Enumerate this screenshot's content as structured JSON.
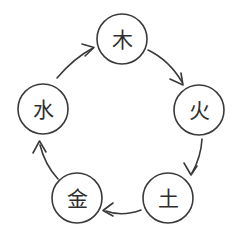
{
  "diagram": {
    "type": "cycle",
    "background_color": "#ffffff",
    "stroke_color": "#3a3a3a",
    "text_color": "#2e2e2e",
    "nodes": [
      {
        "id": "wood",
        "label": "木",
        "cx": 122,
        "cy": 39,
        "r": 25
      },
      {
        "id": "fire",
        "label": "火",
        "cx": 199,
        "cy": 110,
        "r": 25
      },
      {
        "id": "earth",
        "label": "土",
        "cx": 168,
        "cy": 198,
        "r": 25
      },
      {
        "id": "metal",
        "label": "金",
        "cx": 77,
        "cy": 198,
        "r": 25
      },
      {
        "id": "water",
        "label": "水",
        "cx": 43,
        "cy": 109,
        "r": 25
      }
    ],
    "edges": [
      {
        "id": "wood-to-fire",
        "from": "wood",
        "to": "fire",
        "direction": "clockwise"
      },
      {
        "id": "fire-to-earth",
        "from": "fire",
        "to": "earth",
        "direction": "clockwise"
      },
      {
        "id": "earth-to-metal",
        "from": "earth",
        "to": "metal",
        "direction": "clockwise"
      },
      {
        "id": "metal-to-water",
        "from": "metal",
        "to": "water",
        "direction": "clockwise"
      },
      {
        "id": "water-to-wood",
        "from": "water",
        "to": "wood",
        "direction": "clockwise"
      }
    ]
  }
}
